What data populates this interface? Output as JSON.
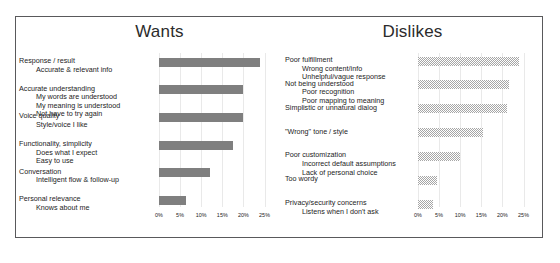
{
  "slide": {
    "panels": [
      {
        "id": "wants",
        "title": "Wants",
        "axis": {
          "ticks": [
            "0%",
            "5%",
            "10%",
            "15%",
            "20%",
            "25%"
          ],
          "min": 0,
          "max": 27
        },
        "rows": [
          {
            "main": "Response / result",
            "subs": [
              "Accurate & relevant info"
            ],
            "value": 24.0
          },
          {
            "main": "Accurate understanding",
            "subs": [
              "My words are understood",
              "My meaning is understood",
              "Not have to try again"
            ],
            "value": 20.0
          },
          {
            "main": "Voice quality",
            "subs": [
              "Style/voice I like"
            ],
            "value": 20.0
          },
          {
            "main": "Functionality, simplicity",
            "subs": [
              "Does what I expect",
              "Easy to use"
            ],
            "value": 17.5
          },
          {
            "main": "Conversation",
            "subs": [
              "Intelligent flow & follow-up"
            ],
            "value": 12.0
          },
          {
            "main": "Personal relevance",
            "subs": [
              "Knows about me"
            ],
            "value": 6.5
          }
        ]
      },
      {
        "id": "dislikes",
        "title": "Dislikes",
        "axis": {
          "ticks": [
            "0%",
            "5%",
            "10%",
            "15%",
            "20%",
            "25%"
          ],
          "min": 0,
          "max": 27
        },
        "rows": [
          {
            "main": "Poor fulfillment",
            "subs": [
              "Wrong content/info",
              "Unhelpful/vague response"
            ],
            "value": 24.0
          },
          {
            "main": "Not being understood",
            "subs": [
              "Poor recognition",
              "Poor mapping to meaning"
            ],
            "value": 21.5
          },
          {
            "main": "Simplistic or unnatural dialog",
            "subs": [],
            "value": 21.0
          },
          {
            "main": "\"Wrong\" tone / style",
            "subs": [],
            "value": 15.5
          },
          {
            "main": "Poor customization",
            "subs": [
              "Incorrect default assumptions",
              "Lack of personal choice"
            ],
            "value": 10.0
          },
          {
            "main": "Too wordy",
            "subs": [],
            "value": 4.5
          },
          {
            "main": "Privacy/security concerns",
            "subs": [
              "Listens when I don't ask"
            ],
            "value": 3.5
          }
        ]
      }
    ]
  },
  "chart_data": [
    {
      "type": "bar",
      "title": "Wants",
      "orientation": "horizontal",
      "xlabel": "",
      "ylabel": "",
      "xlim": [
        0,
        27
      ],
      "xticks": [
        "0%",
        "5%",
        "10%",
        "15%",
        "20%",
        "25%"
      ],
      "grid": true,
      "legend": "none",
      "categories": [
        "Response / result",
        "Accurate understanding",
        "Voice quality",
        "Functionality, simplicity",
        "Conversation",
        "Personal relevance"
      ],
      "values": [
        24.0,
        20.0,
        20.0,
        17.5,
        12.0,
        6.5
      ],
      "annotations": [
        "Accurate & relevant info",
        "My words are understood",
        "My meaning is understood",
        "Not have to try again",
        "Style/voice I like",
        "Does what I expect",
        "Easy to use",
        "Intelligent flow & follow-up",
        "Knows about me"
      ]
    },
    {
      "type": "bar",
      "title": "Dislikes",
      "orientation": "horizontal",
      "xlabel": "",
      "ylabel": "",
      "xlim": [
        0,
        27
      ],
      "xticks": [
        "0%",
        "5%",
        "10%",
        "15%",
        "20%",
        "25%"
      ],
      "grid": true,
      "legend": "none",
      "categories": [
        "Poor fulfillment",
        "Not being understood",
        "Simplistic or unnatural dialog",
        "\"Wrong\" tone / style",
        "Poor customization",
        "Too wordy",
        "Privacy/security concerns"
      ],
      "values": [
        24.0,
        21.5,
        21.0,
        15.5,
        10.0,
        4.5,
        3.5
      ],
      "annotations": [
        "Wrong content/info",
        "Unhelpful/vague response",
        "Poor recognition",
        "Poor mapping to meaning",
        "Incorrect default assumptions",
        "Lack of personal choice",
        "Listens when I don't ask"
      ]
    }
  ]
}
